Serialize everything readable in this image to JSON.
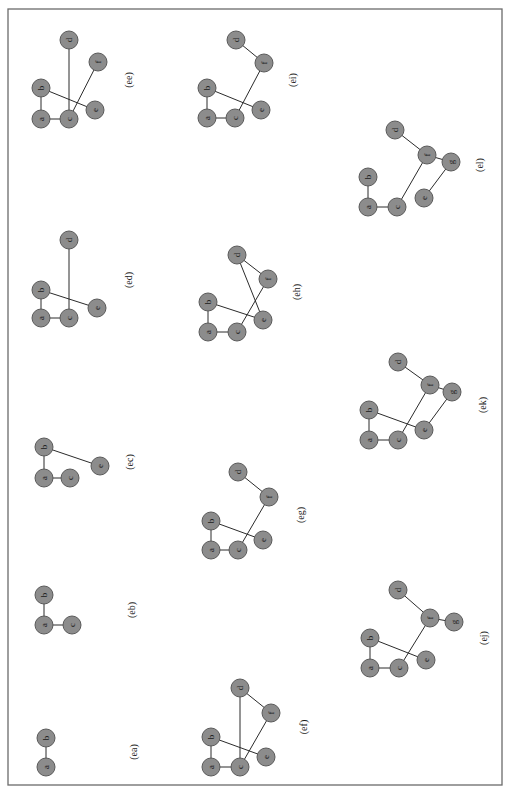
{
  "figure": {
    "orientation": "rotated-90-ccw",
    "node_radius": 9,
    "colors": {
      "node_fill": "#8c8c8c",
      "node_stroke": "#5a5a5a",
      "edge": "#2b2b2b",
      "frame": "#6b6b6b"
    },
    "subfigures": [
      {
        "label": "(ea)",
        "label_pos": [
          133,
          752
        ],
        "nodes": [
          {
            "id": "a",
            "x": 46,
            "y": 767
          },
          {
            "id": "b",
            "x": 46,
            "y": 738
          }
        ],
        "edges": [
          [
            "a",
            "b"
          ]
        ]
      },
      {
        "label": "(eb)",
        "label_pos": [
          131,
          610
        ],
        "nodes": [
          {
            "id": "a",
            "x": 44,
            "y": 625
          },
          {
            "id": "b",
            "x": 44,
            "y": 595
          },
          {
            "id": "c",
            "x": 72,
            "y": 625
          }
        ],
        "edges": [
          [
            "a",
            "b"
          ],
          [
            "a",
            "c"
          ]
        ]
      },
      {
        "label": "(ec)",
        "label_pos": [
          129,
          462
        ],
        "nodes": [
          {
            "id": "a",
            "x": 44,
            "y": 478
          },
          {
            "id": "b",
            "x": 44,
            "y": 447
          },
          {
            "id": "c",
            "x": 70,
            "y": 478
          },
          {
            "id": "e",
            "x": 100,
            "y": 466
          }
        ],
        "edges": [
          [
            "a",
            "b"
          ],
          [
            "a",
            "c"
          ],
          [
            "b",
            "e"
          ]
        ]
      },
      {
        "label": "(ed)",
        "label_pos": [
          128,
          280
        ],
        "nodes": [
          {
            "id": "a",
            "x": 41,
            "y": 318
          },
          {
            "id": "b",
            "x": 41,
            "y": 290
          },
          {
            "id": "c",
            "x": 69,
            "y": 318
          },
          {
            "id": "d",
            "x": 69,
            "y": 240
          },
          {
            "id": "e",
            "x": 97,
            "y": 308
          }
        ],
        "edges": [
          [
            "a",
            "b"
          ],
          [
            "a",
            "c"
          ],
          [
            "b",
            "e"
          ],
          [
            "c",
            "d"
          ]
        ]
      },
      {
        "label": "(ee)",
        "label_pos": [
          128,
          80
        ],
        "nodes": [
          {
            "id": "a",
            "x": 41,
            "y": 119
          },
          {
            "id": "b",
            "x": 41,
            "y": 88
          },
          {
            "id": "c",
            "x": 69,
            "y": 119
          },
          {
            "id": "d",
            "x": 69,
            "y": 40
          },
          {
            "id": "e",
            "x": 95,
            "y": 110
          },
          {
            "id": "f",
            "x": 98,
            "y": 62
          }
        ],
        "edges": [
          [
            "a",
            "b"
          ],
          [
            "a",
            "c"
          ],
          [
            "b",
            "e"
          ],
          [
            "c",
            "d"
          ],
          [
            "c",
            "f"
          ]
        ]
      },
      {
        "label": "(ef)",
        "label_pos": [
          303,
          727
        ],
        "nodes": [
          {
            "id": "a",
            "x": 211,
            "y": 767
          },
          {
            "id": "b",
            "x": 211,
            "y": 737
          },
          {
            "id": "c",
            "x": 240,
            "y": 767
          },
          {
            "id": "d",
            "x": 240,
            "y": 688
          },
          {
            "id": "e",
            "x": 266,
            "y": 757
          },
          {
            "id": "f",
            "x": 271,
            "y": 713
          }
        ],
        "edges": [
          [
            "a",
            "b"
          ],
          [
            "a",
            "c"
          ],
          [
            "b",
            "e"
          ],
          [
            "c",
            "d"
          ],
          [
            "c",
            "f"
          ],
          [
            "f",
            "d"
          ]
        ]
      },
      {
        "label": "(eg)",
        "label_pos": [
          300,
          515
        ],
        "nodes": [
          {
            "id": "a",
            "x": 211,
            "y": 550
          },
          {
            "id": "b",
            "x": 211,
            "y": 521
          },
          {
            "id": "c",
            "x": 238,
            "y": 550
          },
          {
            "id": "d",
            "x": 238,
            "y": 472
          },
          {
            "id": "e",
            "x": 263,
            "y": 540
          },
          {
            "id": "f",
            "x": 269,
            "y": 497
          }
        ],
        "edges": [
          [
            "a",
            "b"
          ],
          [
            "a",
            "c"
          ],
          [
            "b",
            "e"
          ],
          [
            "c",
            "f"
          ],
          [
            "f",
            "d"
          ]
        ]
      },
      {
        "label": "(eh)",
        "label_pos": [
          296,
          292
        ],
        "nodes": [
          {
            "id": "a",
            "x": 208,
            "y": 332
          },
          {
            "id": "b",
            "x": 208,
            "y": 302
          },
          {
            "id": "c",
            "x": 237,
            "y": 332
          },
          {
            "id": "d",
            "x": 237,
            "y": 255
          },
          {
            "id": "e",
            "x": 263,
            "y": 320
          },
          {
            "id": "f",
            "x": 268,
            "y": 279
          }
        ],
        "edges": [
          [
            "a",
            "b"
          ],
          [
            "a",
            "c"
          ],
          [
            "b",
            "e"
          ],
          [
            "c",
            "f"
          ],
          [
            "f",
            "d"
          ],
          [
            "d",
            "e"
          ]
        ]
      },
      {
        "label": "(ei)",
        "label_pos": [
          292,
          80
        ],
        "nodes": [
          {
            "id": "a",
            "x": 207,
            "y": 118
          },
          {
            "id": "b",
            "x": 207,
            "y": 88
          },
          {
            "id": "c",
            "x": 235,
            "y": 118
          },
          {
            "id": "d",
            "x": 236,
            "y": 40
          },
          {
            "id": "e",
            "x": 261,
            "y": 110
          },
          {
            "id": "f",
            "x": 264,
            "y": 63
          }
        ],
        "edges": [
          [
            "a",
            "b"
          ],
          [
            "a",
            "c"
          ],
          [
            "b",
            "e"
          ],
          [
            "c",
            "f"
          ],
          [
            "f",
            "d"
          ]
        ]
      },
      {
        "label": "(ej)",
        "label_pos": [
          483,
          638
        ],
        "nodes": [
          {
            "id": "a",
            "x": 370,
            "y": 668
          },
          {
            "id": "b",
            "x": 370,
            "y": 638
          },
          {
            "id": "c",
            "x": 399,
            "y": 668
          },
          {
            "id": "d",
            "x": 398,
            "y": 590
          },
          {
            "id": "e",
            "x": 426,
            "y": 660
          },
          {
            "id": "f",
            "x": 430,
            "y": 618
          },
          {
            "id": "g",
            "x": 454,
            "y": 622
          }
        ],
        "edges": [
          [
            "a",
            "b"
          ],
          [
            "a",
            "c"
          ],
          [
            "b",
            "e"
          ],
          [
            "c",
            "f"
          ],
          [
            "f",
            "d"
          ],
          [
            "f",
            "g"
          ]
        ]
      },
      {
        "label": "(ek)",
        "label_pos": [
          482,
          405
        ],
        "nodes": [
          {
            "id": "a",
            "x": 369,
            "y": 440
          },
          {
            "id": "b",
            "x": 369,
            "y": 410
          },
          {
            "id": "c",
            "x": 398,
            "y": 440
          },
          {
            "id": "d",
            "x": 398,
            "y": 362
          },
          {
            "id": "e",
            "x": 424,
            "y": 430
          },
          {
            "id": "f",
            "x": 430,
            "y": 385
          },
          {
            "id": "g",
            "x": 452,
            "y": 392
          }
        ],
        "edges": [
          [
            "a",
            "b"
          ],
          [
            "a",
            "c"
          ],
          [
            "b",
            "e"
          ],
          [
            "c",
            "f"
          ],
          [
            "f",
            "d"
          ],
          [
            "f",
            "g"
          ],
          [
            "g",
            "e"
          ]
        ]
      },
      {
        "label": "(el)",
        "label_pos": [
          479,
          165
        ],
        "nodes": [
          {
            "id": "a",
            "x": 368,
            "y": 207
          },
          {
            "id": "b",
            "x": 368,
            "y": 177
          },
          {
            "id": "c",
            "x": 397,
            "y": 207
          },
          {
            "id": "d",
            "x": 395,
            "y": 130
          },
          {
            "id": "e",
            "x": 424,
            "y": 198
          },
          {
            "id": "f",
            "x": 427,
            "y": 155
          },
          {
            "id": "g",
            "x": 451,
            "y": 162
          }
        ],
        "edges": [
          [
            "a",
            "b"
          ],
          [
            "a",
            "c"
          ],
          [
            "c",
            "f"
          ],
          [
            "f",
            "d"
          ],
          [
            "f",
            "g"
          ],
          [
            "g",
            "e"
          ]
        ]
      }
    ]
  }
}
